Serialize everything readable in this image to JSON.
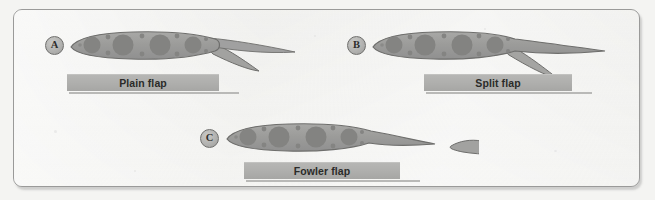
{
  "figure": {
    "background_color": "#f4f4f2",
    "frame_color": "#9a9a99",
    "panel_count": 3
  },
  "colors": {
    "wing_fill": "#9d9d9b",
    "wing_stroke": "#6e6e6c",
    "hole_fill": "#838381",
    "flap_fill": "#a4a4a2",
    "caption_bar": "#aeaeac",
    "caption_text": "#2b2b29",
    "marker_fill": "#b2b2b0",
    "marker_stroke": "#6f6f6d",
    "paper": "#f1f1ef"
  },
  "panels": [
    {
      "id": "panel-a",
      "marker": "A",
      "caption": "Plain flap",
      "description": "Hinged rear portion of the wing deflects downward as one piece",
      "flap_type": "plain"
    },
    {
      "id": "panel-b",
      "marker": "B",
      "caption": "Split flap",
      "description": "Lower surface panel hinges down while the upper surface stays fixed",
      "flap_type": "split"
    },
    {
      "id": "panel-c",
      "marker": "C",
      "caption": "Fowler flap",
      "description": "Flap slides aft and down, separating from the wing to form a slot",
      "flap_type": "fowler"
    }
  ]
}
